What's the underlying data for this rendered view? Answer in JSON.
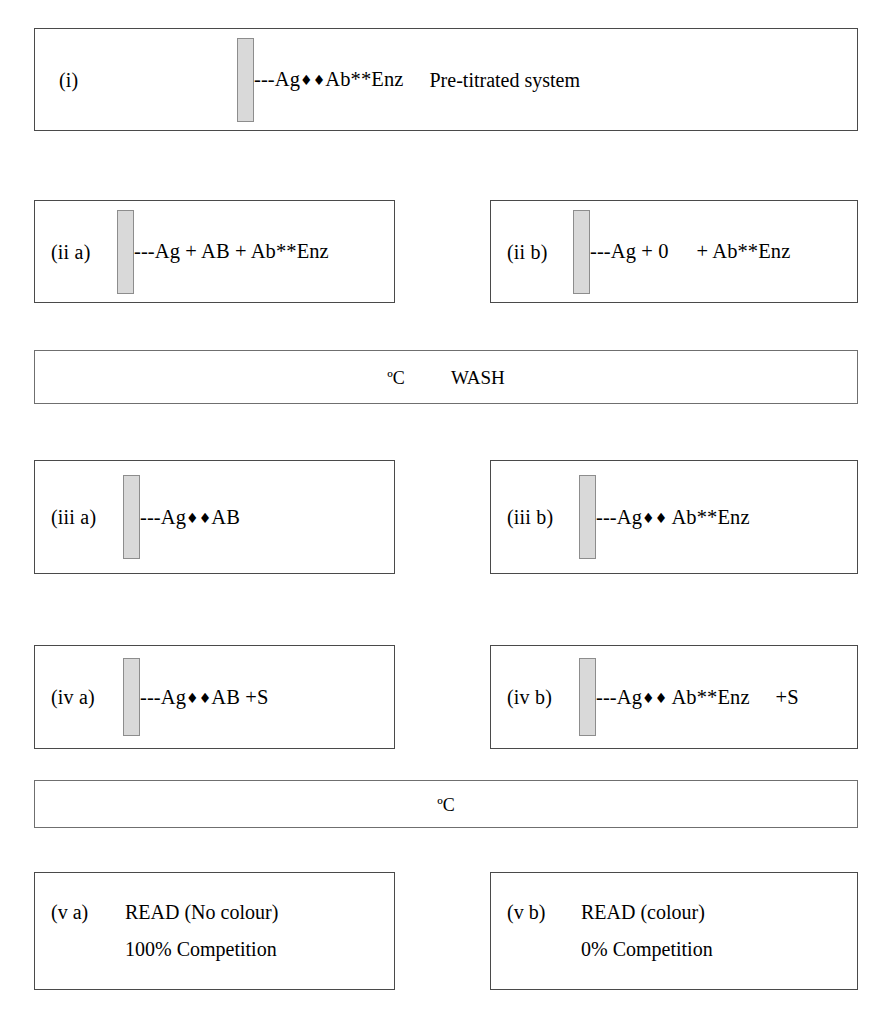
{
  "figure": {
    "solid_phase_icon": "solid-phase-bar",
    "link_dashes": "---"
  },
  "steps": [
    {
      "id": "i",
      "label": "(i)",
      "formula_prefix": "---Ag",
      "markers": "♦♦",
      "formula_suffix": "Ab**Enz",
      "note": "Pre-titrated system"
    },
    {
      "id": "iia",
      "label": "(ii a)",
      "formula": "---Ag + AB + Ab**Enz"
    },
    {
      "id": "iib",
      "label": "(ii b)",
      "formula_a": "---Ag + 0",
      "formula_b": "+ Ab**Enz"
    },
    {
      "id": "iiia",
      "label": "(iii a)",
      "formula_prefix": "---Ag",
      "markers": "♦♦",
      "formula_suffix": "AB"
    },
    {
      "id": "iiib",
      "label": "(iii b)",
      "formula_prefix": "---Ag",
      "markers": "♦♦",
      "formula_suffix": " Ab**Enz"
    },
    {
      "id": "iva",
      "label": "(iv a)",
      "formula_prefix": "---Ag",
      "markers": "♦♦",
      "formula_suffix": "AB +S"
    },
    {
      "id": "ivb",
      "label": "(iv b)",
      "formula_prefix": "---Ag",
      "markers": "♦♦",
      "formula_suffix": " Ab**Enz",
      "extra": "+S"
    }
  ],
  "bands": [
    {
      "id": "band-wash",
      "temperature": "ºC",
      "action": "WASH"
    },
    {
      "id": "band-incubate",
      "temperature": "ºC",
      "action": ""
    }
  ],
  "readouts": [
    {
      "id": "va",
      "label": "(v a)",
      "line1": "READ (No colour)",
      "line2": "100% Competition"
    },
    {
      "id": "vb",
      "label": "(v b)",
      "label_alt": "(v b)",
      "line1": "READ (colour)",
      "line2": "0% Competition"
    }
  ],
  "colors": {
    "background": "#ffffff",
    "ink": "#000000",
    "panel_border": "#4a4a4a",
    "solid_phase_fill": "#d9d9d9",
    "solid_phase_border": "#8d8d8d"
  }
}
